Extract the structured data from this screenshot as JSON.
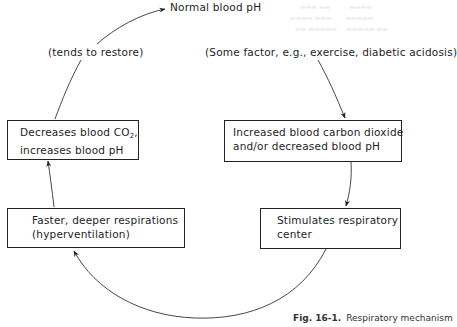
{
  "diagram": {
    "type": "feedback-cycle",
    "top_label": "Normal blood pH",
    "left_arc_label": "(tends to restore)",
    "trigger_label": "(Some factor, e.g., exercise, diabetic acidosis)",
    "boxes": {
      "increased_co2": {
        "line1": "Increased blood carbon dioxide",
        "line2": "and/or decreased blood pH"
      },
      "stimulates": {
        "line1": "Stimulates respiratory",
        "line2": "center"
      },
      "faster_respirations": {
        "line1": "Faster, deeper respirations",
        "line2": "(hyperventilation)"
      },
      "decreases_co2": {
        "line1_prefix": "Decreases blood CO",
        "line1_sub": "2",
        "line1_suffix": ",",
        "line2": "increases blood pH"
      }
    },
    "flow": [
      "(Some factor, e.g., exercise, diabetic acidosis)",
      "Increased blood carbon dioxide and/or decreased blood pH",
      "Stimulates respiratory center",
      "Faster, deeper respirations (hyperventilation)",
      "Decreases blood CO2, increases blood pH",
      "Normal blood pH"
    ],
    "caption": {
      "figure": "Fig. 16-1.",
      "text": "Respiratory mechanism"
    }
  }
}
